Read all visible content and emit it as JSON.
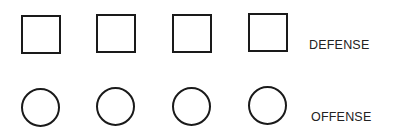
{
  "diagram": {
    "rows": [
      {
        "label": "DEFENSE",
        "shape": "square-icon",
        "count": 4
      },
      {
        "label": "OFFENSE",
        "shape": "circle-icon",
        "count": 4
      }
    ],
    "colors": {
      "stroke": "#1a1a1a",
      "text": "#222222",
      "background": "#ffffff"
    }
  }
}
